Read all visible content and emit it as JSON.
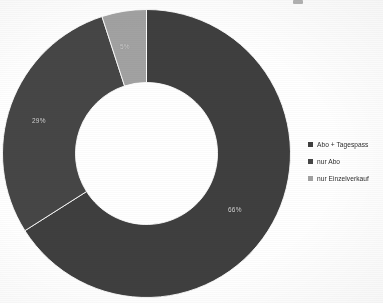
{
  "chart_data": {
    "type": "pie",
    "variant": "donut",
    "title": "",
    "subtitle": "",
    "xlabel": "",
    "ylabel": "",
    "grid": false,
    "legend_position": "right",
    "start_angle_deg": 0,
    "direction": "clockwise",
    "inner_radius_ratio": 0.49,
    "categories": [
      "Abo + Tagespass",
      "nur Abo",
      "nur Einzelverkauf"
    ],
    "values": [
      66,
      29,
      5
    ],
    "value_unit": "%",
    "data_labels": [
      "66%",
      "29%",
      "5%"
    ],
    "colors": [
      "#3f3f3f",
      "#464646",
      "#a2a2a2"
    ],
    "slices": [
      {
        "label": "Abo + Tagespass",
        "value": 66,
        "display": "66%",
        "color": "#3f3f3f",
        "label_color": "#d8d8d8"
      },
      {
        "label": "nur Abo",
        "value": 29,
        "display": "29%",
        "color": "#464646",
        "label_color": "#d8d8d8"
      },
      {
        "label": "nur Einzelverkauf",
        "value": 5,
        "display": "5%",
        "color": "#a2a2a2",
        "label_color": "#d8d8d8"
      }
    ]
  },
  "legend": {
    "items": [
      {
        "label": "Abo + Tagespass",
        "color": "#3f3f3f"
      },
      {
        "label": "nur Abo",
        "color": "#464646"
      },
      {
        "label": "nur Einzelverkauf",
        "color": "#a2a2a2"
      }
    ]
  },
  "labels": {
    "slice_66": "66%",
    "slice_29": "29%",
    "slice_5": "5%"
  }
}
